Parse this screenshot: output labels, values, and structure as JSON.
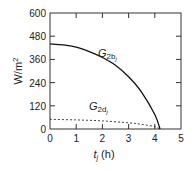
{
  "chart_data": {
    "type": "line",
    "title": "",
    "xlabel": "t_j (h)",
    "ylabel": "W/m2",
    "xlim": [
      0,
      5
    ],
    "ylim": [
      0,
      600
    ],
    "xticks": [
      0,
      1,
      2,
      3,
      4,
      5
    ],
    "yticks": [
      0,
      120,
      240,
      360,
      480,
      600
    ],
    "grid": false,
    "legend": "inline labels",
    "series": [
      {
        "name": "G2bj",
        "style": "solid",
        "x": [
          0,
          0.5,
          1,
          1.5,
          2,
          2.5,
          3,
          3.5,
          4,
          4.2
        ],
        "values": [
          440,
          435,
          423,
          400,
          370,
          330,
          270,
          190,
          75,
          0
        ]
      },
      {
        "name": "G2dj",
        "style": "dashed",
        "x": [
          0,
          1,
          2,
          3,
          3.5,
          4,
          4.2
        ],
        "values": [
          50,
          47,
          42,
          32,
          24,
          12,
          0
        ]
      }
    ],
    "annotations": [
      {
        "text": "G2bj",
        "x": 2.6,
        "y": 375
      },
      {
        "text": "G2dj",
        "x": 2.1,
        "y": 78
      }
    ]
  },
  "labels": {
    "y_axis_main": "W/m",
    "y_axis_sup": "2",
    "x_axis_t": "t",
    "x_axis_sub": "j",
    "x_axis_unit": " (h)",
    "curve1_G": "G",
    "curve1_sub": "2b",
    "curve1_subsub": "j",
    "curve2_G": "G",
    "curve2_sub": "2d",
    "curve2_subsub": "j"
  },
  "ticks": {
    "x": [
      "0",
      "1",
      "2",
      "3",
      "4",
      "5"
    ],
    "y": [
      "0",
      "120",
      "240",
      "360",
      "480",
      "600"
    ]
  }
}
